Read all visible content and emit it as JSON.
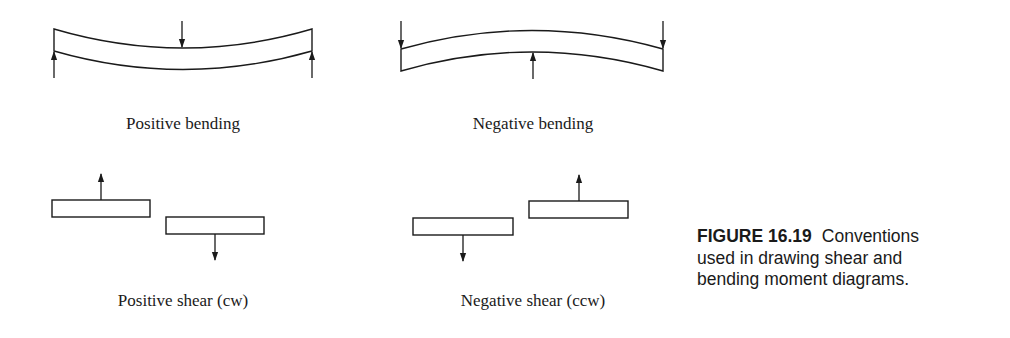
{
  "figure": {
    "number": "FIGURE 16.19",
    "caption_text": "Conventions used in drawing shear and bending moment diagrams.",
    "caption_lines": [
      "Conventions",
      "used in drawing shear and",
      "bending moment diagrams."
    ]
  },
  "panels": {
    "positive_bending": {
      "label": "Positive bending"
    },
    "negative_bending": {
      "label": "Negative bending"
    },
    "positive_shear": {
      "label": "Positive shear (cw)"
    },
    "negative_shear": {
      "label": "Negative shear (ccw)"
    }
  },
  "colors": {
    "line": "#1a1a1a",
    "background": "#ffffff"
  }
}
